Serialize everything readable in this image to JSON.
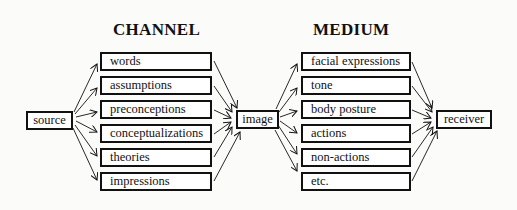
{
  "headings": {
    "channel": "CHANNEL",
    "medium": "MEDIUM"
  },
  "nodes": {
    "source": "source",
    "image": "image",
    "receiver": "receiver"
  },
  "channel_items": [
    "words",
    "assumptions",
    "preconceptions",
    "conceptualizations",
    "theories",
    "impressions"
  ],
  "medium_items": [
    "facial expressions",
    "tone",
    "body posture",
    "actions",
    "non-actions",
    "etc."
  ]
}
